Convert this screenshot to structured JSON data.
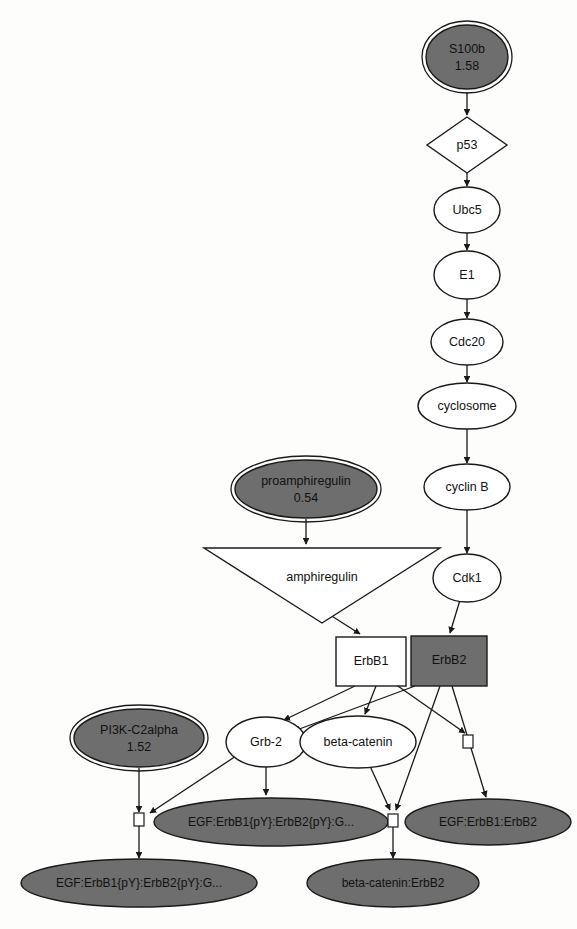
{
  "diagram": {
    "type": "biological-pathway-network",
    "background": "#fdfdfc",
    "colors": {
      "node_fill_highlight": "#6e6e6e",
      "node_fill_plain": "#ffffff",
      "stroke": "#1a1a1a",
      "text": "#111111"
    },
    "nodes": [
      {
        "id": "s100b",
        "label": "S100b",
        "value": "1.58",
        "shape": "ellipse",
        "style": "filled-double-border",
        "cx": 467,
        "cy": 57,
        "rx": 42,
        "ry": 33
      },
      {
        "id": "p53",
        "label": "p53",
        "value": "",
        "shape": "diamond",
        "style": "plain",
        "cx": 467,
        "cy": 145,
        "rx": 40,
        "ry": 28
      },
      {
        "id": "ubc5",
        "label": "Ubc5",
        "value": "",
        "shape": "ellipse",
        "style": "plain",
        "cx": 467,
        "cy": 210,
        "rx": 33,
        "ry": 22
      },
      {
        "id": "e1",
        "label": "E1",
        "value": "",
        "shape": "ellipse",
        "style": "plain",
        "cx": 467,
        "cy": 275,
        "rx": 33,
        "ry": 23
      },
      {
        "id": "cdc20",
        "label": "Cdc20",
        "value": "",
        "shape": "ellipse",
        "style": "plain",
        "cx": 467,
        "cy": 342,
        "rx": 36,
        "ry": 22
      },
      {
        "id": "cyclosome",
        "label": "cyclosome",
        "value": "",
        "shape": "ellipse",
        "style": "plain",
        "cx": 467,
        "cy": 406,
        "rx": 48,
        "ry": 22
      },
      {
        "id": "cyclinb",
        "label": "cyclin B",
        "value": "",
        "shape": "ellipse",
        "style": "plain",
        "cx": 467,
        "cy": 487,
        "rx": 42,
        "ry": 22
      },
      {
        "id": "cdk1",
        "label": "Cdk1",
        "value": "",
        "shape": "ellipse",
        "style": "plain",
        "cx": 467,
        "cy": 578,
        "rx": 34,
        "ry": 23
      },
      {
        "id": "proamphiregulin",
        "label": "proamphiregulin",
        "value": "0.54",
        "shape": "ellipse",
        "style": "filled-double-border",
        "cx": 306,
        "cy": 489,
        "rx": 72,
        "ry": 30
      },
      {
        "id": "amphiregulin",
        "label": "amphiregulin",
        "value": "",
        "shape": "inverted-triangle",
        "style": "plain",
        "cx": 322,
        "cy": 585,
        "rx": 118,
        "ry": 38
      },
      {
        "id": "erbb1",
        "label": "ErbB1",
        "value": "",
        "shape": "rect",
        "style": "plain",
        "cx": 371,
        "cy": 661,
        "rx": 35,
        "ry": 24
      },
      {
        "id": "erbb2",
        "label": "ErbB2",
        "value": "",
        "shape": "rect",
        "style": "filled",
        "cx": 449,
        "cy": 660,
        "rx": 38,
        "ry": 25
      },
      {
        "id": "pi3k",
        "label": "PI3K-C2alpha",
        "value": "1.52",
        "shape": "ellipse",
        "style": "filled-double-border",
        "cx": 139,
        "cy": 738,
        "rx": 66,
        "ry": 30
      },
      {
        "id": "grb2",
        "label": "Grb-2",
        "value": "",
        "shape": "ellipse",
        "style": "plain",
        "cx": 266,
        "cy": 742,
        "rx": 40,
        "ry": 24
      },
      {
        "id": "betacatenin",
        "label": "beta-catenin",
        "value": "",
        "shape": "ellipse",
        "style": "plain",
        "cx": 358,
        "cy": 742,
        "rx": 57,
        "ry": 25
      },
      {
        "id": "egf-complex-mid",
        "label": "EGF:ErbB1{pY}:ErbB2{pY}:G...",
        "value": "",
        "shape": "ellipse",
        "style": "filled",
        "cx": 271,
        "cy": 822,
        "rx": 116,
        "ry": 23
      },
      {
        "id": "egf-erbb1-erbb2",
        "label": "EGF:ErbB1:ErbB2",
        "value": "",
        "shape": "ellipse",
        "style": "filled",
        "cx": 488,
        "cy": 822,
        "rx": 82,
        "ry": 22
      },
      {
        "id": "egf-complex-left",
        "label": "EGF:ErbB1{pY}:ErbB2{pY}:G...",
        "value": "",
        "shape": "ellipse",
        "style": "filled",
        "cx": 139,
        "cy": 883,
        "rx": 117,
        "ry": 23
      },
      {
        "id": "betacatenin-erbb2",
        "label": "beta-catenin:ErbB2",
        "value": "",
        "shape": "ellipse",
        "style": "filled",
        "cx": 393,
        "cy": 883,
        "rx": 85,
        "ry": 23
      }
    ],
    "edges": [
      {
        "from": "s100b",
        "to": "p53",
        "arrow": true
      },
      {
        "from": "p53",
        "to": "ubc5",
        "arrow": true
      },
      {
        "from": "ubc5",
        "to": "e1",
        "arrow": true
      },
      {
        "from": "e1",
        "to": "cdc20",
        "arrow": true
      },
      {
        "from": "cdc20",
        "to": "cyclosome",
        "arrow": true
      },
      {
        "from": "cyclosome",
        "to": "cyclinb",
        "arrow": true
      },
      {
        "from": "cyclinb",
        "to": "cdk1",
        "arrow": true
      },
      {
        "from": "cdk1",
        "to": "erbb2",
        "arrow": true
      },
      {
        "from": "proamphiregulin",
        "to": "amphiregulin",
        "arrow": true
      },
      {
        "from": "amphiregulin",
        "to": "erbb1",
        "arrow": true
      },
      {
        "from": "erbb1",
        "to": "grb2",
        "arrow": true
      },
      {
        "from": "erbb1",
        "to": "betacatenin",
        "arrow": true
      },
      {
        "from": "erbb1",
        "to": "junction-right",
        "arrow": true
      },
      {
        "from": "erbb2",
        "to": "grb2",
        "arrow": true
      },
      {
        "from": "erbb2",
        "to": "junction-center",
        "arrow": true
      },
      {
        "from": "erbb2",
        "to": "egf-erbb1-erbb2",
        "arrow": true
      },
      {
        "from": "grb2",
        "to": "egf-complex-mid",
        "arrow": true
      },
      {
        "from": "grb2",
        "to": "junction-left",
        "arrow": true
      },
      {
        "from": "betacatenin",
        "to": "junction-center",
        "arrow": true
      },
      {
        "from": "pi3k",
        "to": "junction-left",
        "arrow": true
      },
      {
        "from": "junction-left",
        "to": "egf-complex-left",
        "arrow": true
      },
      {
        "from": "junction-center",
        "to": "betacatenin-erbb2",
        "arrow": true
      }
    ],
    "junctions": [
      {
        "id": "junction-left",
        "x": 139,
        "y": 819
      },
      {
        "id": "junction-center",
        "x": 393,
        "y": 820
      },
      {
        "id": "junction-right",
        "x": 468,
        "y": 741
      }
    ]
  }
}
